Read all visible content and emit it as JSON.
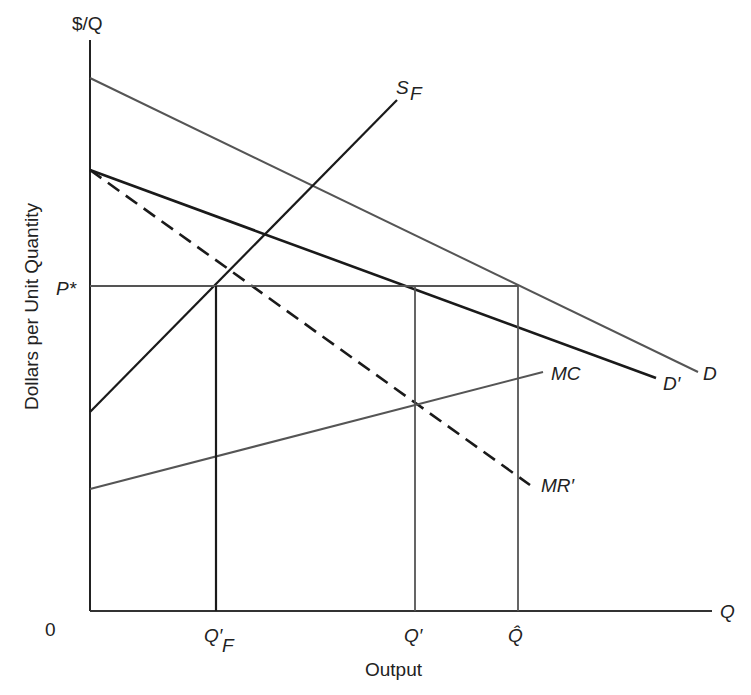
{
  "diagram": {
    "y_axis_label": "Dollars per Unit Quantity",
    "y_axis_top": "$/Q",
    "x_axis_label": "Output",
    "x_axis_end": "Q",
    "origin": "0",
    "price_label": "P*",
    "x_ticks": [
      "Q′F",
      "Q′",
      "Q̂"
    ],
    "curves": {
      "D": "D",
      "D_prime": "D′",
      "S_F": "S",
      "S_F_sub": "F",
      "MC": "MC",
      "MR_prime": "MR′"
    },
    "colors": {
      "dark": "#1a1a1a",
      "gray": "#555555"
    }
  }
}
